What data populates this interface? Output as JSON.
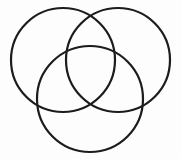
{
  "figure": {
    "name": "three-circle-venn-diagram",
    "type": "venn",
    "background_color": "#fdfdfd",
    "stroke_color": "#1c1c1c",
    "stroke_width": 2.2,
    "fill": "none",
    "width": 181,
    "height": 159,
    "set_count": 3,
    "region_count": 7,
    "labels": [],
    "title": "",
    "caption": ""
  },
  "chart_data": {
    "type": "diagram",
    "title": "",
    "xlabel": "",
    "ylabel": "",
    "grid": false,
    "legend": null,
    "circles": [
      {
        "id": "circle-top-left",
        "cx": 63,
        "cy": 60,
        "r": 52,
        "label": "",
        "stroke": "#1c1c1c",
        "fill": "none"
      },
      {
        "id": "circle-top-right",
        "cx": 118,
        "cy": 60,
        "r": 52,
        "label": "",
        "stroke": "#1c1c1c",
        "fill": "none"
      },
      {
        "id": "circle-bottom-center",
        "cx": 90,
        "cy": 99,
        "r": 53,
        "label": "",
        "stroke": "#1c1c1c",
        "fill": "none"
      }
    ],
    "extents": {
      "leftmost_x": 11,
      "rightmost_x": 170,
      "topmost_y": 8,
      "bottommost_y": 152
    },
    "intersections": [
      {
        "id": "top-circles-upper",
        "x": 90,
        "y": 13
      },
      {
        "id": "top-circles-lower",
        "x": 90,
        "y": 106
      },
      {
        "id": "left-bottom-outer",
        "x": 37,
        "y": 105
      },
      {
        "id": "right-bottom-outer",
        "x": 143,
        "y": 105
      }
    ]
  }
}
